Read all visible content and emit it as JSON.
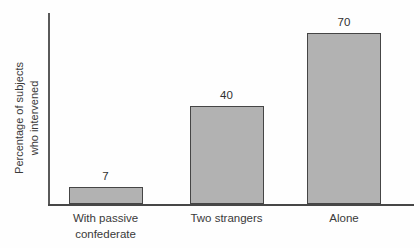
{
  "chart_data": {
    "type": "bar",
    "title": "",
    "categories": [
      "With passive confederate",
      "Two strangers",
      "Alone"
    ],
    "values": [
      7,
      40,
      70
    ],
    "value_labels": [
      "7",
      "40",
      "70"
    ],
    "xlabel": "",
    "ylabel": "Percentage of subjects who intervened",
    "ylabel_lines": [
      "Percentage of subjects",
      "who intervened"
    ],
    "ylim": [
      0,
      80
    ],
    "grid": false,
    "legend": "none",
    "axis_ticks": "none",
    "colors": {
      "bar_fill": "#b2b2b2",
      "bar_border": "#454545",
      "axis": "#4a4a4a",
      "text": "#333333",
      "background": "#ffffff"
    }
  }
}
